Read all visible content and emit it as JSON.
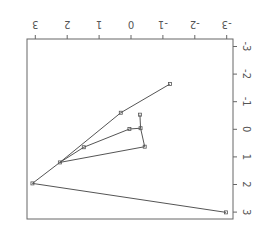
{
  "chart_data": {
    "type": "line",
    "orientation_note": "figure displayed rotated 180 degrees",
    "title": "",
    "xlabel": "",
    "ylabel": "",
    "xlim": [
      -3,
      3
    ],
    "ylim": [
      -3,
      3
    ],
    "x_ticks": [
      3,
      2,
      1,
      0,
      -1,
      -2,
      -3
    ],
    "y_ticks": [
      -3,
      -2,
      -1,
      0,
      1,
      2,
      3
    ],
    "x_tick_labels": [
      "3",
      "2",
      "1",
      "0",
      "-1",
      "-2",
      "-3"
    ],
    "y_tick_labels": [
      "-3",
      "-2",
      "-1",
      "0",
      "1",
      "2",
      "3"
    ],
    "grid": false,
    "legend": null,
    "points": [
      {
        "id": "p1",
        "x": -1.22,
        "y": -1.64
      },
      {
        "id": "p2",
        "x": 0.32,
        "y": -0.6
      },
      {
        "id": "p3",
        "x": -0.28,
        "y": -0.53
      },
      {
        "id": "p4",
        "x": 0.05,
        "y": -0.01
      },
      {
        "id": "p5",
        "x": -0.3,
        "y": -0.04
      },
      {
        "id": "p6",
        "x": 1.48,
        "y": 0.65
      },
      {
        "id": "p7",
        "x": -0.43,
        "y": 0.63
      },
      {
        "id": "p8",
        "x": 2.23,
        "y": 1.2
      },
      {
        "id": "p9",
        "x": 3.09,
        "y": 1.96
      },
      {
        "id": "p10",
        "x": -2.98,
        "y": 3.01
      }
    ],
    "series": [
      {
        "name": "path-a",
        "points": [
          "p10",
          "p9",
          "p8",
          "p2",
          "p1"
        ]
      },
      {
        "name": "path-b",
        "points": [
          "p8",
          "p6",
          "p4",
          "p5"
        ]
      },
      {
        "name": "path-c",
        "points": [
          "p8",
          "p7",
          "p5",
          "p3"
        ]
      }
    ]
  },
  "style": {
    "line_color": "#555555",
    "marker_color": "#555555",
    "frame_color": "#666666",
    "background": "#ffffff"
  }
}
